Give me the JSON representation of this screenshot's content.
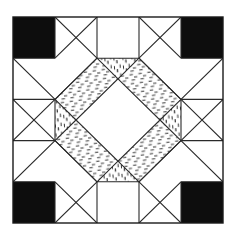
{
  "figure": {
    "title": "Quilt Block Pattern",
    "type": "quilt-block-diagram",
    "grid": {
      "columns": 5,
      "rows": 5
    },
    "canvas": {
      "width": 237,
      "height": 236
    },
    "frame": {
      "x": 13,
      "y": 17,
      "width": 210,
      "height": 206,
      "stroke": "#1a1a1a",
      "stroke_width": 1.4
    },
    "colors": {
      "background": "#ffffff",
      "solid_dark": "#0d0d0d",
      "line": "#2a2a2a",
      "hatch_ink": "#333333",
      "patch_light": "#ffffff"
    },
    "patch_types": [
      {
        "name": "solid-dark-square",
        "fill": "#0d0d0d",
        "count": 4
      },
      {
        "name": "hatched-triangle",
        "fill": "stipple-hatch",
        "count": 24
      },
      {
        "name": "plain-light-triangle",
        "fill": "#ffffff",
        "count": 28
      },
      {
        "name": "center-light-diamond",
        "fill": "#ffffff",
        "count": 1
      }
    ]
  },
  "geometry": {
    "x": [
      13.0,
      55.0,
      97.0,
      139.0,
      181.0,
      223.0
    ],
    "y": [
      17.0,
      58.2,
      99.4,
      140.6,
      181.8,
      223.0
    ],
    "solid_squares": [
      {
        "name": "corner-top-left",
        "col": 0,
        "row": 0
      },
      {
        "name": "corner-top-right",
        "col": 4,
        "row": 0
      },
      {
        "name": "corner-bottom-left",
        "col": 0,
        "row": 4
      },
      {
        "name": "corner-bottom-right",
        "col": 4,
        "row": 4
      }
    ]
  }
}
